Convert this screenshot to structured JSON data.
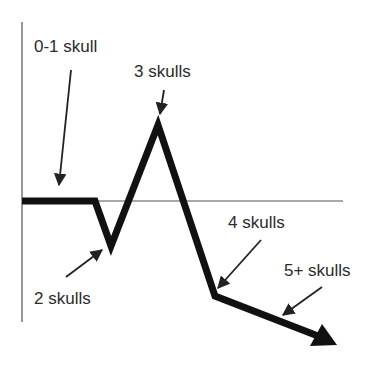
{
  "diagram": {
    "type": "annotated line diagram",
    "axes": {
      "vertical": {
        "x": 22,
        "y_top": 22,
        "y_bottom": 322
      },
      "horizontal": {
        "y": 201,
        "x_left": 22,
        "x_right": 343
      }
    },
    "trend_line": {
      "points": [
        [
          22,
          201
        ],
        [
          95,
          201
        ],
        [
          111,
          246
        ],
        [
          158,
          125
        ],
        [
          215,
          296
        ],
        [
          318,
          336
        ]
      ],
      "arrow_tip": [
        337,
        345
      ],
      "color": "#111111"
    },
    "labels": [
      {
        "id": "label-0-1",
        "text": "0-1 skull",
        "x": 34,
        "y": 52,
        "arrow": [
          [
            71,
            70
          ],
          [
            59,
            185
          ]
        ]
      },
      {
        "id": "label-3",
        "text": "3 skulls",
        "x": 134,
        "y": 77,
        "arrow": [
          [
            164,
            90
          ],
          [
            160,
            114
          ]
        ]
      },
      {
        "id": "label-2",
        "text": "2 skulls",
        "x": 34,
        "y": 304,
        "arrow": [
          [
            66,
            277
          ],
          [
            102,
            250
          ]
        ]
      },
      {
        "id": "label-4",
        "text": "4 skulls",
        "x": 228,
        "y": 228,
        "arrow": [
          [
            261,
            240
          ],
          [
            218,
            288
          ]
        ]
      },
      {
        "id": "label-5plus",
        "text": "5+ skulls",
        "x": 284,
        "y": 276,
        "arrow": [
          [
            322,
            287
          ],
          [
            283,
            315
          ]
        ]
      }
    ]
  }
}
